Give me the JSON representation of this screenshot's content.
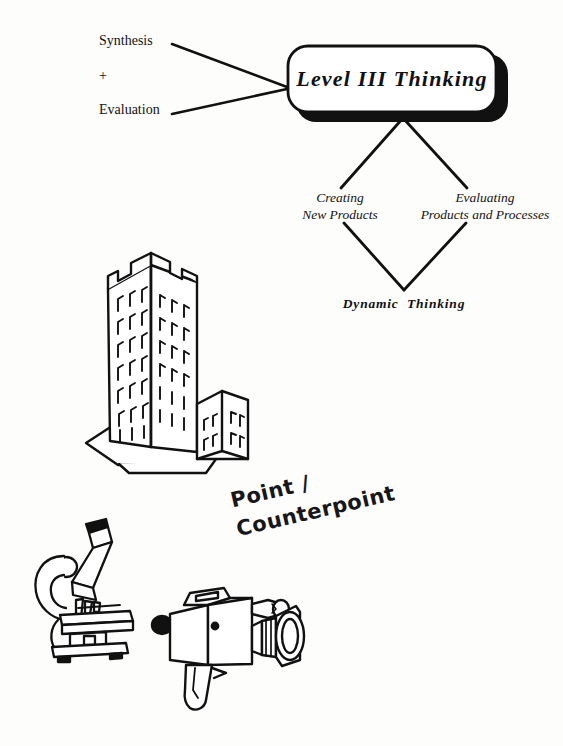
{
  "page": {
    "background_color": "#fdfdfc",
    "ink_color": "#111111"
  },
  "diagram": {
    "inputs": {
      "line1": "Synthesis",
      "line2": "+",
      "line3": "Evaluation"
    },
    "main_box": {
      "title": "Level III Thinking",
      "shadow_color": "#111111",
      "fill_color": "#ffffff"
    },
    "branches": [
      {
        "line1": "Creating",
        "line2": "New Products"
      },
      {
        "line1": "Evaluating",
        "line2": "Products and Processes"
      }
    ],
    "outcome": "Dynamic  Thinking"
  },
  "annotation": {
    "line1": "Point /",
    "line2": "Counterpoint"
  },
  "illustrations": [
    {
      "name": "skyscraper-building",
      "caption": ""
    },
    {
      "name": "microscope",
      "caption": ""
    },
    {
      "name": "video-camera",
      "caption": ""
    }
  ]
}
